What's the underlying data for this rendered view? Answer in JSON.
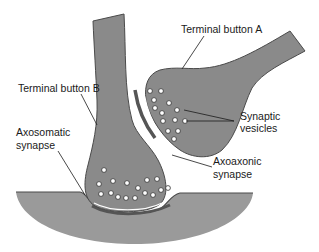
{
  "diagram": {
    "type": "neuron-synapse-illustration",
    "labels": {
      "terminal_button_a": "Terminal button A",
      "terminal_button_b": "Terminal button B",
      "synaptic_vesicles_line1": "Synaptic",
      "synaptic_vesicles_line2": "vesicles",
      "axoaxonic_line1": "Axoaxonic",
      "axoaxonic_line2": "synapse",
      "axosomatic_line1": "Axosomatic",
      "axosomatic_line2": "synapse"
    },
    "colors": {
      "neuron_fill": "#8a8a8a",
      "soma_fill": "#9a9a9a",
      "outline": "#4a4a4a",
      "membrane_dark": "#555555",
      "vesicle_fill": "#ffffff",
      "background": "#ffffff"
    }
  }
}
